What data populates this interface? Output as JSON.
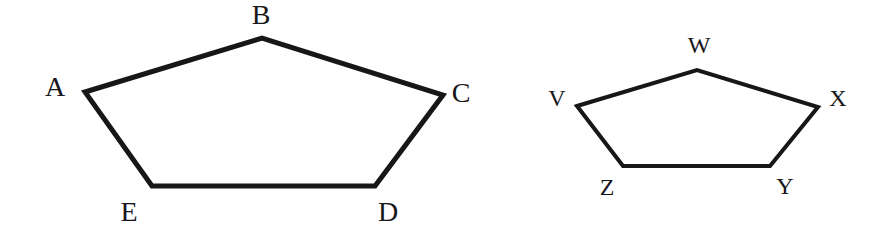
{
  "figure": {
    "background_color": "#ffffff",
    "stroke_color": "#17171a",
    "label_color": "#17171a",
    "width": 896,
    "height": 232,
    "shapes": [
      {
        "id": "pentagon-abcde",
        "name": "large-pentagon",
        "stroke_width": 5,
        "points": "85,92 262,38 443,95 375,186 152,186",
        "vertices": [
          {
            "key": "A",
            "label": "A",
            "point_x": 85,
            "point_y": 92,
            "label_x": 55,
            "label_y": 87,
            "size": "large"
          },
          {
            "key": "B",
            "label": "B",
            "point_x": 262,
            "point_y": 38,
            "label_x": 261,
            "label_y": 15,
            "size": "large"
          },
          {
            "key": "C",
            "label": "C",
            "point_x": 443,
            "point_y": 95,
            "label_x": 461,
            "label_y": 93,
            "size": "large"
          },
          {
            "key": "D",
            "label": "D",
            "point_x": 375,
            "point_y": 186,
            "label_x": 388,
            "label_y": 212,
            "size": "large"
          },
          {
            "key": "E",
            "label": "E",
            "point_x": 152,
            "point_y": 186,
            "label_x": 129,
            "label_y": 212,
            "size": "large"
          }
        ]
      },
      {
        "id": "pentagon-vwxyz",
        "name": "small-pentagon",
        "stroke_width": 4,
        "points": "577,106 697,70 818,107 770,166 623,166",
        "vertices": [
          {
            "key": "V",
            "label": "V",
            "point_x": 577,
            "point_y": 106,
            "label_x": 557,
            "label_y": 98,
            "size": "small"
          },
          {
            "key": "W",
            "label": "W",
            "point_x": 697,
            "point_y": 70,
            "label_x": 699,
            "label_y": 45,
            "size": "small"
          },
          {
            "key": "X",
            "label": "X",
            "point_x": 818,
            "point_y": 107,
            "label_x": 838,
            "label_y": 98,
            "size": "small"
          },
          {
            "key": "Y",
            "label": "Y",
            "point_x": 770,
            "point_y": 166,
            "label_x": 785,
            "label_y": 186,
            "size": "small"
          },
          {
            "key": "Z",
            "label": "Z",
            "point_x": 623,
            "point_y": 166,
            "label_x": 607,
            "label_y": 187,
            "size": "small"
          }
        ]
      }
    ]
  }
}
